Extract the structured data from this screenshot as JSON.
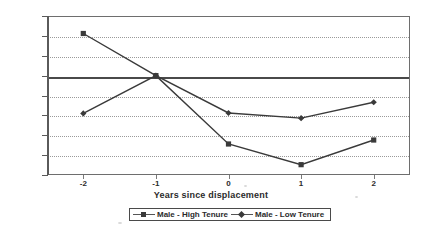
{
  "chart_data": {
    "type": "line",
    "title": "",
    "xlabel": "Years since displacement",
    "ylabel": "",
    "x": [
      -2,
      -1,
      0,
      1,
      2
    ],
    "xticklabels": [
      "-2",
      "-1",
      "0",
      "1",
      "2"
    ],
    "yticklabels": [
      "15000",
      "10000",
      "5000",
      "0",
      "-5000",
      "-10000",
      "-15000",
      "-20000",
      "-25000"
    ],
    "yticks": [
      15000,
      10000,
      5000,
      0,
      -5000,
      -10000,
      -15000,
      -20000,
      -25000
    ],
    "ylim": [
      -25000,
      15000
    ],
    "xlim": [
      -2.5,
      2.5
    ],
    "grid": "horizontal-dotted",
    "legend_position": "bottom-center",
    "series": [
      {
        "name": "Male - High Tenure",
        "marker": "square",
        "color": "#3a3a3a",
        "values": [
          10600,
          0,
          -17200,
          -22400,
          -16200
        ]
      },
      {
        "name": "Male - Low Tenure",
        "marker": "diamond",
        "color": "#3a3a3a",
        "values": [
          -9500,
          0,
          -9400,
          -10700,
          -6700
        ]
      }
    ]
  },
  "legend": {
    "entries": [
      {
        "label": "Male - High Tenure",
        "marker": "square"
      },
      {
        "label": "Male - Low Tenure",
        "marker": "diamond"
      }
    ]
  },
  "axis": {
    "x_title": "Years since displacement"
  }
}
